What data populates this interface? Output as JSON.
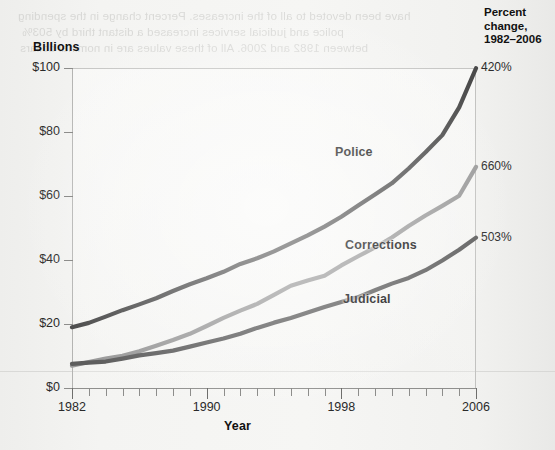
{
  "figure": {
    "y_axis_title": "Billions",
    "x_axis_title": "Year",
    "right_axis_title_line1": "Percent",
    "right_axis_title_line2": "change,",
    "right_axis_title_line3": "1982–2006"
  },
  "ghost_text": {
    "line1": "have been devoted to all of the increases. Percent change in the spending",
    "line2": "police and judicial services increased a distant third by 503%",
    "line3": "between 1982 and 2006. All of these values are in nominal dollars"
  },
  "chart_data": {
    "type": "line",
    "title": "",
    "xlabel": "Year",
    "ylabel": "Billions",
    "xlim": [
      1982,
      2006
    ],
    "ylim": [
      0,
      100
    ],
    "ytick_labels": [
      "$0",
      "$20",
      "$40",
      "$60",
      "$80",
      "$100"
    ],
    "ytick_values": [
      0,
      20,
      40,
      60,
      80,
      100
    ],
    "xtick_labels": [
      "1982",
      "1990",
      "1998",
      "2006"
    ],
    "xtick_values": [
      1982,
      1990,
      1998,
      2006
    ],
    "grid": false,
    "legend": "inline-labels",
    "x": [
      1982,
      1983,
      1984,
      1985,
      1986,
      1987,
      1988,
      1989,
      1990,
      1991,
      1992,
      1993,
      1994,
      1995,
      1996,
      1997,
      1998,
      1999,
      2000,
      2001,
      2002,
      2003,
      2004,
      2005,
      2006
    ],
    "series": [
      {
        "name": "Police",
        "label": "Police",
        "color": "#4a4a4a",
        "percent_change": "420%",
        "values": [
          19.0,
          20.6,
          22.4,
          24.3,
          26.3,
          28.2,
          30.1,
          32.2,
          34.3,
          36.3,
          38.6,
          40.6,
          43.0,
          45.3,
          47.6,
          50.5,
          53.6,
          56.8,
          60.2,
          64.0,
          68.7,
          73.6,
          79.1,
          88.0,
          100.0
        ]
      },
      {
        "name": "Corrections",
        "label": "Corrections",
        "color": "#9a9a9a",
        "percent_change": "660%",
        "values": [
          7.0,
          7.9,
          9.0,
          10.2,
          11.6,
          13.2,
          15.1,
          17.2,
          19.4,
          21.7,
          24.1,
          26.3,
          28.9,
          31.8,
          33.8,
          35.3,
          38.3,
          41.2,
          44.1,
          47.0,
          50.3,
          53.8,
          57.0,
          60.0,
          69.0
        ]
      },
      {
        "name": "Judicial",
        "label": "Judicial",
        "color": "#5e5e5e",
        "percent_change": "503%",
        "values": [
          7.5,
          7.9,
          8.4,
          9.1,
          9.9,
          10.8,
          11.8,
          12.9,
          14.2,
          15.7,
          17.2,
          18.7,
          20.3,
          21.9,
          23.5,
          25.0,
          26.8,
          28.6,
          30.6,
          32.6,
          34.6,
          37.0,
          39.7,
          43.0,
          47.0
        ]
      }
    ]
  }
}
